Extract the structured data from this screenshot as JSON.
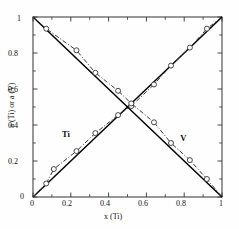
{
  "chart_data": {
    "type": "line",
    "title": "",
    "subtitle": "",
    "xlabel": "x (Ti)",
    "ylabel": "a (Ti) or a (V)",
    "xlim": [
      0,
      1
    ],
    "ylim": [
      0,
      1
    ],
    "grid": false,
    "legend_position": "inline-annotation",
    "xticks": [
      0,
      0.2,
      0.4,
      0.6,
      0.8,
      1
    ],
    "xticklabels": [
      "0",
      "0.2",
      "0.4",
      "0.6",
      "0.8",
      "1"
    ],
    "xminorticks": [
      0.1,
      0.3,
      0.5,
      0.7,
      0.9
    ],
    "yticks": [
      0,
      0.2,
      0.4,
      0.6,
      0.8,
      1
    ],
    "yticklabels": [
      "0",
      "0.2",
      "0.4",
      "0.6",
      "0.8",
      "1"
    ],
    "yminorticks": [
      0.1,
      0.3,
      0.5,
      0.7,
      0.9
    ],
    "annotations": [
      {
        "text": "Ti",
        "x": 0.185,
        "y": 0.345
      },
      {
        "text": "V",
        "x": 0.795,
        "y": 0.325
      }
    ],
    "series": [
      {
        "name": "Ti ideal (Raoult)",
        "style": "solid",
        "color": "#000000",
        "marker": "none",
        "x": [
          0,
          1
        ],
        "y": [
          0,
          1
        ]
      },
      {
        "name": "V ideal (Raoult)",
        "style": "solid",
        "color": "#000000",
        "marker": "none",
        "x": [
          0,
          1
        ],
        "y": [
          1,
          0
        ]
      },
      {
        "name": "a (Ti) measured",
        "style": "dash-dot",
        "color": "#3a3a3a",
        "marker": "open-circle",
        "x": [
          0.0,
          0.07,
          0.11,
          0.23,
          0.33,
          0.45,
          0.52,
          0.64,
          0.73,
          0.83,
          0.92,
          1.0
        ],
        "y": [
          0.0,
          0.075,
          0.155,
          0.255,
          0.355,
          0.455,
          0.505,
          0.625,
          0.73,
          0.83,
          0.935,
          1.0
        ]
      },
      {
        "name": "a (V) measured",
        "style": "dash-dot",
        "color": "#3a3a3a",
        "marker": "open-circle",
        "x": [
          0.0,
          0.07,
          0.23,
          0.33,
          0.45,
          0.52,
          0.64,
          0.73,
          0.83,
          0.92,
          1.0
        ],
        "y": [
          1.0,
          0.935,
          0.815,
          0.69,
          0.59,
          0.52,
          0.415,
          0.3,
          0.205,
          0.1,
          0.0
        ]
      }
    ]
  }
}
